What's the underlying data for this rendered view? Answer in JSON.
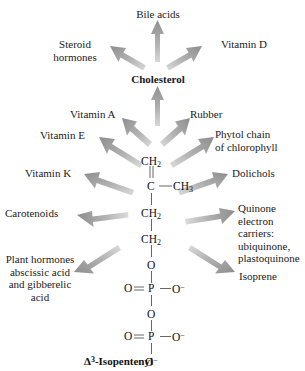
{
  "diagram": {
    "background_color": "#ffffff",
    "arrow_color": "#9a9a9a",
    "text_color": "#1a1a1a"
  },
  "hub": {
    "label": "Cholesterol"
  },
  "cholesterol_products": [
    {
      "label": "Bile acids"
    },
    {
      "label": "Steroid\nhormones"
    },
    {
      "label": "Vitamin D"
    }
  ],
  "ipp_products": [
    {
      "label": "Vitamin A"
    },
    {
      "label": "Vitamin E"
    },
    {
      "label": "Vitamin K"
    },
    {
      "label": "Carotenoids"
    },
    {
      "label": "Plant hormones\nabscissic acid\nand gibberelic\nacid"
    },
    {
      "label": "Rubber"
    },
    {
      "label": "Phytol chain\nof chlorophyll"
    },
    {
      "label": "Dolichols"
    },
    {
      "label": "Quinone\nelectron\ncarriers:\nubiquinone,\nplastoquinone"
    },
    {
      "label": "Isoprene"
    }
  ],
  "structure": {
    "name": "isopentenyl-pyrophosphate",
    "atoms": [
      {
        "text": "CH₂"
      },
      {
        "text": "C"
      },
      {
        "text": "CH₃"
      },
      {
        "text": "CH₂"
      },
      {
        "text": "CH₂"
      },
      {
        "text": "O"
      },
      {
        "text": "O"
      },
      {
        "text": "P"
      },
      {
        "text": "O⁻"
      },
      {
        "text": "O"
      },
      {
        "text": "O"
      },
      {
        "text": "P"
      },
      {
        "text": "O⁻"
      },
      {
        "text": "O⁻"
      }
    ]
  },
  "caption": {
    "text": "Δ3-Isopentenyl",
    "delta": "Δ",
    "superscript": "3",
    "rest": "-Isopentenyl"
  }
}
